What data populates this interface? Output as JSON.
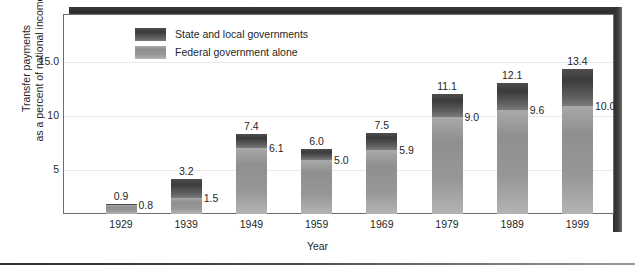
{
  "chart_data": {
    "type": "bar",
    "subtype": "stacked-bar",
    "title": "",
    "xlabel": "Year",
    "ylabel": "Transfer payments as a percent of national income",
    "ylabel_line1": "Transfer payments",
    "ylabel_line2": "as a percent of national income",
    "categories": [
      "1929",
      "1939",
      "1949",
      "1959",
      "1969",
      "1979",
      "1989",
      "1999"
    ],
    "series": [
      {
        "name": "State and local governments",
        "note": "Top labels show the combined total (state, local and federal)",
        "values": [
          0.9,
          3.2,
          7.4,
          6.0,
          7.5,
          11.1,
          12.1,
          13.4
        ],
        "color": "#3b3b3b"
      },
      {
        "name": "Federal government alone",
        "values": [
          0.8,
          1.5,
          6.1,
          5.0,
          5.9,
          9.0,
          9.6,
          10.0
        ],
        "color": "#8f8f8f"
      }
    ],
    "total_labels": [
      "0.9",
      "3.2",
      "7.4",
      "6.0",
      "7.5",
      "11.1",
      "12.1",
      "13.4"
    ],
    "federal_labels": [
      "0.8",
      "1.5",
      "6.1",
      "5.0",
      "5.9",
      "9.0",
      "9.6",
      "10.0"
    ],
    "yticks": [
      5,
      10,
      15
    ],
    "ytick_labels": [
      "5",
      "10",
      "15.0"
    ],
    "ylim": [
      0,
      18.5
    ],
    "grid": true,
    "legend_position": "top-left-inside"
  },
  "legend": {
    "items": [
      {
        "label": "State and local governments",
        "color": "#3b3b3b"
      },
      {
        "label": "Federal government alone",
        "color": "#8f8f8f"
      }
    ]
  },
  "axes": {
    "x_title": "Year",
    "y_title_line1": "Transfer payments",
    "y_title_line2": "as a percent of national income",
    "y_tick_labels": [
      "15.0",
      "10",
      "5"
    ],
    "x_tick_labels": [
      "1929",
      "1939",
      "1949",
      "1959",
      "1969",
      "1979",
      "1989",
      "1999"
    ]
  },
  "colors": {
    "state_local": "#3b3b3b",
    "federal": "#8f8f8f",
    "frame": "#6d6d6d",
    "gridline": "#e9e9ec",
    "background": "#ffffff",
    "text": "#1f1f1f"
  }
}
